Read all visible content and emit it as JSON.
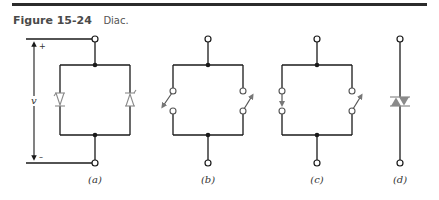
{
  "figure": {
    "number": "Figure 15-24",
    "title": "Diac."
  },
  "panels": [
    {
      "id": "a",
      "label": "(a)",
      "description": "Two Zener/four-layer diode symbols in antiparallel branches, with voltage v indicated between + and - terminals"
    },
    {
      "id": "b",
      "label": "(b)",
      "description": "Equivalent circuit with two switches in parallel branches, one closing downward-left, one upward-right"
    },
    {
      "id": "c",
      "label": "(c)",
      "description": "Equivalent circuit with left switch closed (arrow down) and right switch open"
    },
    {
      "id": "d",
      "label": "(d)",
      "description": "Schematic symbol of a diac"
    }
  ],
  "annotations": {
    "voltage_symbol": "v",
    "plus_sign": "+",
    "minus_sign": "–"
  },
  "colors": {
    "line": "#1a1a1a",
    "component_gray": "#8a8a8a",
    "rule": "#2b2b2b"
  }
}
